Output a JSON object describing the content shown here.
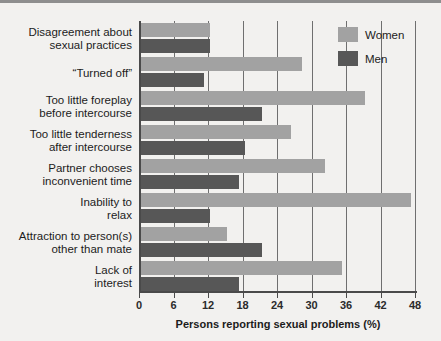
{
  "chart_data": {
    "type": "bar",
    "orientation": "horizontal",
    "title": "",
    "xlabel": "Persons reporting sexual problems (%)",
    "ylabel": "",
    "xlim": [
      0,
      48
    ],
    "xticks": [
      0,
      6,
      12,
      18,
      24,
      30,
      36,
      42,
      48
    ],
    "xtick_labels": [
      "0",
      "6",
      "12",
      "18",
      "24",
      "30",
      "36",
      "42",
      "48"
    ],
    "grid": true,
    "legend_position": "top-right",
    "categories": [
      "Disagreement about sexual practices",
      "“Turned off”",
      "Too little foreplay before intercourse",
      "Too little tenderness after intercourse",
      "Partner chooses inconvenient time",
      "Inability to relax",
      "Attraction to person(s) other than mate",
      "Lack of interest"
    ],
    "category_lines": [
      [
        "Disagreement about",
        "sexual practices"
      ],
      [
        "“Turned off”"
      ],
      [
        "Too little foreplay",
        "before intercourse"
      ],
      [
        "Too little tenderness",
        "after intercourse"
      ],
      [
        "Partner chooses",
        "inconvenient time"
      ],
      [
        "Inability to",
        "relax"
      ],
      [
        "Attraction to person(s)",
        "other than mate"
      ],
      [
        "Lack of",
        "interest"
      ]
    ],
    "series": [
      {
        "name": "Women",
        "color": "#a2a2a2",
        "values": [
          12,
          28,
          39,
          26,
          32,
          47,
          15,
          35
        ]
      },
      {
        "name": "Men",
        "color": "#575757",
        "values": [
          12,
          11,
          21,
          18,
          17,
          12,
          21,
          17
        ]
      }
    ]
  },
  "legend": {
    "items": [
      {
        "label": "Women",
        "color": "#a2a2a2"
      },
      {
        "label": "Men",
        "color": "#575757"
      }
    ]
  },
  "axis": {
    "x_title": "Persons reporting sexual problems (%)"
  },
  "colors": {
    "women_bar": "#a2a2a2",
    "men_bar": "#575757",
    "background": "#f2f1ef",
    "axis": "#4a4a4a",
    "gridline": "#6f6f6f",
    "text": "#1c1c1c"
  }
}
